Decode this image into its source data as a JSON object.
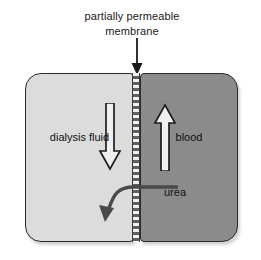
{
  "diagram": {
    "title_caption": {
      "line1": "partially permeable",
      "line2": "membrane"
    },
    "compartments": {
      "left": {
        "label": "dialysis fluid",
        "fill_color": "#dcdcdc",
        "flow_direction": "down"
      },
      "right": {
        "label": "blood",
        "fill_color": "#8b8b8b",
        "flow_direction": "up"
      }
    },
    "membrane": {
      "name": "partially permeable membrane",
      "pattern": "checkered",
      "light_color": "#f2f2f2",
      "dark_color": "#5f5f5f"
    },
    "solute": {
      "label": "urea",
      "direction": "blood-to-dialysis-fluid"
    },
    "colors": {
      "outline": "#2b2b2b",
      "arrow_fill": "#f0f0f0",
      "text": "#111111"
    }
  }
}
